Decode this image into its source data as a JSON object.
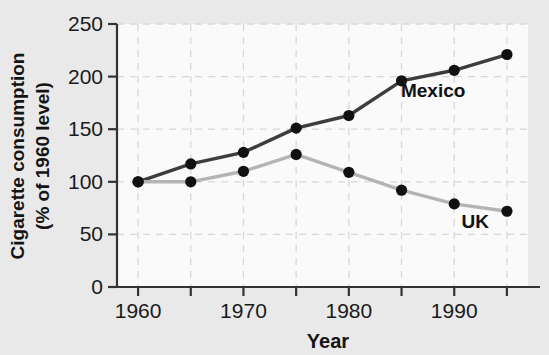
{
  "chart_data": {
    "type": "line",
    "title": "",
    "xlabel": "Year",
    "ylabel": "Cigarette consumption (% of 1960 level)",
    "ylabel_line1": "Cigarette consumption",
    "ylabel_line2": "(% of 1960 level)",
    "x": [
      1960,
      1965,
      1970,
      1975,
      1980,
      1985,
      1990,
      1995
    ],
    "xlim": [
      1958,
      1997
    ],
    "ylim": [
      0,
      250
    ],
    "xticks": [
      1960,
      1965,
      1970,
      1975,
      1980,
      1985,
      1990,
      1995
    ],
    "xtick_labels": [
      "1960",
      "",
      "1970",
      "",
      "1980",
      "",
      "1990",
      ""
    ],
    "yticks": [
      0,
      50,
      100,
      150,
      200,
      250
    ],
    "ytick_labels": [
      "0",
      "50",
      "100",
      "150",
      "200",
      "250"
    ],
    "grid": true,
    "grid_style": "dashed",
    "legend_position": "inline-annotation",
    "series": [
      {
        "name": "Mexico",
        "color": "#3d3d3d",
        "marker_color": "#111111",
        "label_x": 1988,
        "label_y": 181,
        "values": [
          100,
          117,
          128,
          151,
          163,
          196,
          206,
          221
        ]
      },
      {
        "name": "UK",
        "color": "#b4b4b4",
        "marker_color": "#111111",
        "label_x": 1992,
        "label_y": 56,
        "values": [
          100,
          100,
          110,
          126,
          109,
          92,
          79,
          72
        ]
      }
    ]
  },
  "colors": {
    "page_background": "#e9e9e9",
    "plot_background": "#fafafa",
    "axis": "#333333",
    "grid": "#d8d8d8",
    "mexico_line": "#3d3d3d",
    "uk_line": "#b4b4b4",
    "marker": "#111111",
    "text": "#141414"
  }
}
